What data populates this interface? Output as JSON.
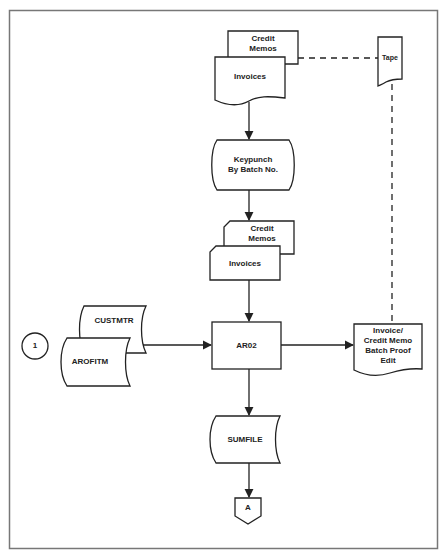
{
  "diagram": {
    "title": "",
    "colors": {
      "stroke": "#222222",
      "frame": "#555555",
      "background": "#ffffff"
    },
    "nodes": {
      "credit_memos_doc": {
        "label": "Credit\nMemos",
        "shape": "document"
      },
      "invoices_doc": {
        "label": "Invoices",
        "shape": "document"
      },
      "tape": {
        "label": "Tape",
        "shape": "punched-tape"
      },
      "keypunch": {
        "label": "Keypunch\nBy Batch No.",
        "shape": "offline-storage-manual"
      },
      "credit_memos_card": {
        "label": "Credit\nMemos",
        "shape": "punched-card"
      },
      "invoices_card": {
        "label": "Invoices",
        "shape": "punched-card"
      },
      "connector_1": {
        "label": "1",
        "shape": "circle-connector"
      },
      "custmtr": {
        "label": "CUSTMTR",
        "shape": "stored-data"
      },
      "arofitm": {
        "label": "AROFITM",
        "shape": "stored-data"
      },
      "ar02": {
        "label": "AR02",
        "shape": "process"
      },
      "proof_edit": {
        "label": "Invoice/\nCredit Memo\nBatch Proof\nEdit",
        "shape": "document"
      },
      "sumfile": {
        "label": "SUMFILE",
        "shape": "stored-data"
      },
      "connector_a": {
        "label": "A",
        "shape": "off-page-connector"
      }
    },
    "edges": [
      {
        "from": "invoices_doc",
        "to": "keypunch",
        "style": "solid-arrow"
      },
      {
        "from": "keypunch",
        "to": "credit_memos_card",
        "style": "solid-arrow"
      },
      {
        "from": "invoices_card",
        "to": "ar02",
        "style": "solid-arrow"
      },
      {
        "from": "custmtr",
        "to": "ar02",
        "style": "solid-arrow"
      },
      {
        "from": "ar02",
        "to": "proof_edit",
        "style": "solid-arrow"
      },
      {
        "from": "ar02",
        "to": "sumfile",
        "style": "solid-arrow"
      },
      {
        "from": "sumfile",
        "to": "connector_a",
        "style": "solid-arrow"
      },
      {
        "from": "credit_memos_doc",
        "to": "tape",
        "style": "dashed"
      },
      {
        "from": "tape",
        "to": "proof_edit",
        "style": "dashed"
      }
    ]
  }
}
